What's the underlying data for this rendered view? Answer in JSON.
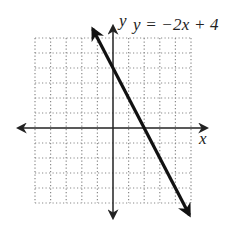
{
  "chart_data": {
    "type": "line",
    "title": "",
    "equation": "y = −2x + 4",
    "xlabel": "x",
    "ylabel": "y",
    "xlim": [
      -5,
      5
    ],
    "ylim": [
      -5,
      6
    ],
    "grid": true,
    "grid_style": "dotted",
    "grid_step": 1,
    "series": [
      {
        "name": "y = −2x + 4",
        "slope": -2,
        "intercept": 4,
        "x": [
          -1.3,
          0,
          2,
          4.9
        ],
        "y": [
          6.6,
          4,
          0,
          -5.8
        ],
        "arrows_both_ends": true
      }
    ],
    "key_points": {
      "y_intercept": [
        0,
        4
      ],
      "x_intercept": [
        2,
        0
      ]
    },
    "legend": []
  },
  "labels": {
    "equation": "y = −2x + 4",
    "x_axis": "x",
    "y_axis": "y"
  },
  "colors": {
    "line": "#111111",
    "axes": "#222222",
    "grid": "#8a8a8a",
    "background": "#ffffff"
  }
}
